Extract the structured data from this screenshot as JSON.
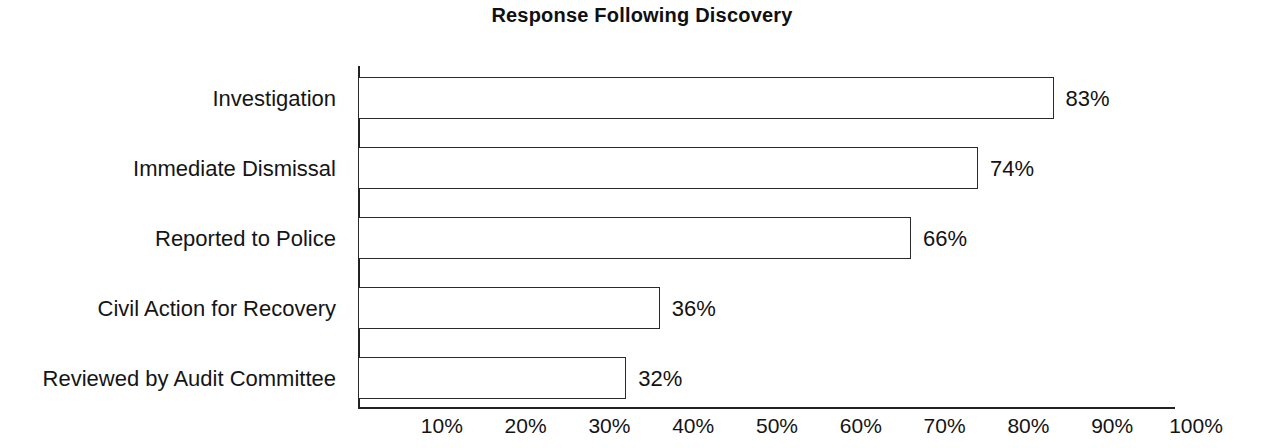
{
  "chart_data": {
    "type": "bar",
    "orientation": "horizontal",
    "title": "Response Following Discovery",
    "xlabel": "",
    "ylabel": "",
    "categories": [
      "Investigation",
      "Immediate Dismissal",
      "Reported to Police",
      "Civil Action for Recovery",
      "Reviewed by Audit Committee"
    ],
    "values": [
      83,
      74,
      66,
      36,
      32
    ],
    "value_labels": [
      "83%",
      "74%",
      "66%",
      "36%",
      "32%"
    ],
    "xlim": [
      0,
      100
    ],
    "xticks": [
      10,
      20,
      30,
      40,
      50,
      60,
      70,
      80,
      90,
      100
    ],
    "xtick_labels": [
      "10%",
      "20%",
      "30%",
      "40%",
      "50%",
      "60%",
      "70%",
      "80%",
      "90%",
      "100%"
    ],
    "grid": false,
    "legend": false,
    "bar_fill_color": "#ffffff",
    "bar_edge_color": "#2a2a2a",
    "text_color": "#141414",
    "background_color": "#ffffff"
  }
}
